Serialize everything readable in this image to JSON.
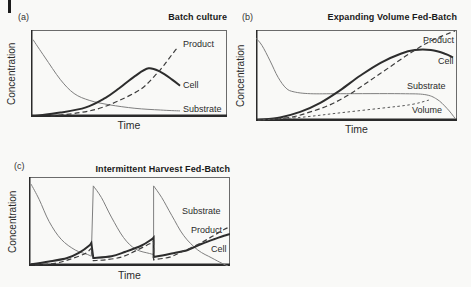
{
  "page": {
    "background": "#f9f9f7",
    "margin_mark_color": "#1c1c1c"
  },
  "styles": {
    "axis_color": "#2a2a2a",
    "frame_color": "#6b6b6b",
    "text_color": "#2b2b2b",
    "line_styles": {
      "thin": {
        "width": 1,
        "color": "#7f7f7f",
        "dash": ""
      },
      "thick": {
        "width": 2,
        "color": "#2d2d2d",
        "dash": ""
      },
      "dashed": {
        "width": 1.2,
        "color": "#3c3c3c",
        "dash": "5 3"
      },
      "fine_dashed": {
        "width": 1,
        "color": "#565656",
        "dash": "2.5 2.5"
      }
    }
  },
  "chart_data": [
    {
      "id": "a",
      "tag": "(a)",
      "type": "line",
      "title": "Batch culture",
      "xlabel": "Time",
      "ylabel": "Concentration",
      "x_range": [
        0,
        100
      ],
      "y_range": [
        0,
        100
      ],
      "normalized_units": true,
      "ticks": false,
      "legend": "inline-labels",
      "series": [
        {
          "name": "Substrate",
          "style": "thin",
          "segments": [
            [
              [
                1,
                89
              ],
              [
                7,
                69
              ],
              [
                15,
                43
              ],
              [
                22,
                27
              ],
              [
                30,
                19
              ],
              [
                40,
                14
              ],
              [
                53,
                10
              ],
              [
                66,
                8
              ],
              [
                76,
                7
              ]
            ]
          ]
        },
        {
          "name": "Cell",
          "style": "thick",
          "segments": [
            [
              [
                1,
                1
              ],
              [
                15,
                5
              ],
              [
                28,
                11
              ],
              [
                38,
                22
              ],
              [
                45,
                33
              ],
              [
                53,
                47
              ],
              [
                60,
                56
              ],
              [
                66,
                52
              ],
              [
                72,
                43
              ],
              [
                76,
                36
              ]
            ]
          ]
        },
        {
          "name": "Product",
          "style": "dashed",
          "segments": [
            [
              [
                10,
                1
              ],
              [
                25,
                5
              ],
              [
                35,
                10
              ],
              [
                45,
                19
              ],
              [
                56,
                32
              ],
              [
                63,
                47
              ],
              [
                68,
                60
              ],
              [
                73,
                75
              ],
              [
                75,
                80
              ]
            ]
          ]
        }
      ]
    },
    {
      "id": "b",
      "tag": "(b)",
      "type": "line",
      "title": "Expanding Volume Fed-Batch",
      "xlabel": "Time",
      "ylabel": "Concentration",
      "x_range": [
        0,
        100
      ],
      "y_range": [
        0,
        100
      ],
      "normalized_units": true,
      "ticks": false,
      "legend": "inline-labels",
      "series": [
        {
          "name": "Substrate",
          "style": "thin",
          "segments": [
            [
              [
                0,
                91
              ],
              [
                3,
                83
              ],
              [
                7,
                66
              ],
              [
                11,
                48
              ],
              [
                15,
                36
              ],
              [
                19,
                32
              ],
              [
                27,
                30
              ],
              [
                42,
                30
              ],
              [
                72,
                30
              ],
              [
                84,
                29
              ],
              [
                90,
                24
              ],
              [
                95,
                14
              ],
              [
                99,
                3
              ]
            ]
          ]
        },
        {
          "name": "Cell",
          "style": "thick",
          "segments": [
            [
              [
                1,
                1
              ],
              [
                12,
                4
              ],
              [
                22,
                10
              ],
              [
                32,
                20
              ],
              [
                42,
                34
              ],
              [
                52,
                50
              ],
              [
                62,
                64
              ],
              [
                72,
                74
              ],
              [
                79,
                78
              ],
              [
                87,
                78
              ],
              [
                94,
                74
              ],
              [
                98,
                70
              ]
            ]
          ]
        },
        {
          "name": "Product",
          "style": "dashed",
          "segments": [
            [
              [
                2,
                1
              ],
              [
                17,
                4
              ],
              [
                27,
                10
              ],
              [
                37,
                18
              ],
              [
                47,
                30
              ],
              [
                57,
                45
              ],
              [
                67,
                60
              ],
              [
                77,
                75
              ],
              [
                87,
                88
              ],
              [
                99,
                99
              ]
            ]
          ]
        },
        {
          "name": "Volume",
          "style": "fine_dashed",
          "segments": [
            [
              [
                1,
                1
              ],
              [
                22,
                4
              ],
              [
                42,
                9
              ],
              [
                62,
                14
              ],
              [
                77,
                18
              ],
              [
                86,
                23
              ]
            ]
          ]
        }
      ]
    },
    {
      "id": "c",
      "tag": "(c)",
      "type": "line",
      "title": "Intermittent Harvest Fed-Batch",
      "xlabel": "Time",
      "ylabel": "Concentration",
      "x_range": [
        0,
        100
      ],
      "y_range": [
        0,
        100
      ],
      "normalized_units": true,
      "ticks": false,
      "legend": "inline-labels",
      "series": [
        {
          "name": "Substrate",
          "style": "thin",
          "segments": [
            [
              [
                1,
                92
              ],
              [
                5,
                75
              ],
              [
                10,
                50
              ],
              [
                16,
                30
              ],
              [
                23,
                18
              ],
              [
                29,
                13
              ],
              [
                31,
                11
              ]
            ],
            [
              [
                32,
                90
              ],
              [
                36,
                77
              ],
              [
                41,
                55
              ],
              [
                47,
                32
              ],
              [
                53,
                19
              ],
              [
                60,
                14
              ],
              [
                62,
                13
              ]
            ],
            [
              [
                62,
                90
              ],
              [
                66,
                77
              ],
              [
                71,
                57
              ],
              [
                77,
                34
              ],
              [
                84,
                18
              ],
              [
                91,
                9
              ],
              [
                96,
                3
              ],
              [
                99,
                0
              ]
            ]
          ]
        },
        {
          "name": "Cell",
          "style": "thick",
          "segments": [
            [
              [
                1,
                2
              ],
              [
                10,
                5
              ],
              [
                19,
                9
              ],
              [
                25,
                15
              ],
              [
                30,
                23
              ],
              [
                31,
                26
              ]
            ],
            [
              [
                32,
                9
              ],
              [
                41,
                11
              ],
              [
                48,
                16
              ],
              [
                56,
                23
              ],
              [
                61,
                30
              ],
              [
                62,
                32
              ]
            ],
            [
              [
                62,
                10
              ],
              [
                71,
                14
              ],
              [
                79,
                18
              ],
              [
                86,
                25
              ],
              [
                92,
                30
              ],
              [
                97,
                34
              ],
              [
                100,
                36
              ]
            ]
          ]
        },
        {
          "name": "Product",
          "style": "dashed",
          "segments": [
            [
              [
                3,
                1
              ],
              [
                13,
                3
              ],
              [
                21,
                8
              ],
              [
                28,
                14
              ],
              [
                31,
                20
              ]
            ],
            [
              [
                32,
                6
              ],
              [
                38,
                7
              ],
              [
                46,
                10
              ],
              [
                53,
                17
              ],
              [
                60,
                25
              ],
              [
                62,
                28
              ]
            ],
            [
              [
                62,
                7
              ],
              [
                70,
                10
              ],
              [
                76,
                16
              ],
              [
                84,
                24
              ],
              [
                91,
                33
              ],
              [
                97,
                41
              ],
              [
                100,
                44
              ]
            ]
          ]
        }
      ]
    }
  ]
}
